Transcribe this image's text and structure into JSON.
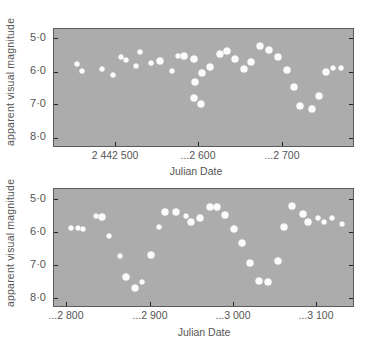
{
  "chart_data": [
    {
      "type": "scatter",
      "title": "",
      "xlabel": "Julian Date",
      "ylabel": "apparent visual magnitude",
      "xticks": [
        2442500,
        2442600,
        2442700
      ],
      "xtick_labels": [
        "2 442 500",
        "...2 600",
        "...2 700"
      ],
      "yticks": [
        5.0,
        6.0,
        7.0,
        8.0
      ],
      "ytick_labels": [
        "5·0",
        "6·0",
        "7·0",
        "8·0"
      ],
      "xlim": [
        2442453,
        2442790
      ],
      "ylim": [
        8.2,
        4.7
      ],
      "y_inverted": true,
      "grid": false,
      "points": [
        {
          "x": 2442454,
          "y": 5.78,
          "s": "m"
        },
        {
          "x": 2442460,
          "y": 5.99,
          "s": "m"
        },
        {
          "x": 2442484,
          "y": 5.93,
          "s": "m"
        },
        {
          "x": 2442498,
          "y": 6.11,
          "s": "m"
        },
        {
          "x": 2442507,
          "y": 5.57,
          "s": "m"
        },
        {
          "x": 2442513,
          "y": 5.66,
          "s": "m"
        },
        {
          "x": 2442525,
          "y": 5.84,
          "s": "m"
        },
        {
          "x": 2442530,
          "y": 5.42,
          "s": "m"
        },
        {
          "x": 2442543,
          "y": 5.75,
          "s": "m"
        },
        {
          "x": 2442554,
          "y": 5.69,
          "s": "l"
        },
        {
          "x": 2442569,
          "y": 5.99,
          "s": "m"
        },
        {
          "x": 2442576,
          "y": 5.54,
          "s": "m"
        },
        {
          "x": 2442583,
          "y": 5.54,
          "s": "l"
        },
        {
          "x": 2442595,
          "y": 5.63,
          "s": "l"
        },
        {
          "x": 2442605,
          "y": 6.05,
          "s": "l"
        },
        {
          "x": 2442596,
          "y": 6.32,
          "s": "l"
        },
        {
          "x": 2442595,
          "y": 6.8,
          "s": "l"
        },
        {
          "x": 2442604,
          "y": 6.98,
          "s": "l"
        },
        {
          "x": 2442614,
          "y": 5.87,
          "s": "l"
        },
        {
          "x": 2442626,
          "y": 5.48,
          "s": "l"
        },
        {
          "x": 2442635,
          "y": 5.39,
          "s": "l"
        },
        {
          "x": 2442645,
          "y": 5.63,
          "s": "l"
        },
        {
          "x": 2442656,
          "y": 5.93,
          "s": "l"
        },
        {
          "x": 2442664,
          "y": 5.72,
          "s": "l"
        },
        {
          "x": 2442675,
          "y": 5.24,
          "s": "l"
        },
        {
          "x": 2442686,
          "y": 5.36,
          "s": "l"
        },
        {
          "x": 2442696,
          "y": 5.57,
          "s": "l"
        },
        {
          "x": 2442707,
          "y": 5.96,
          "s": "l"
        },
        {
          "x": 2442716,
          "y": 6.47,
          "s": "l"
        },
        {
          "x": 2442723,
          "y": 7.04,
          "s": "l"
        },
        {
          "x": 2442737,
          "y": 7.13,
          "s": "l"
        },
        {
          "x": 2442746,
          "y": 6.74,
          "s": "l"
        },
        {
          "x": 2442754,
          "y": 6.02,
          "s": "l"
        },
        {
          "x": 2442763,
          "y": 5.9,
          "s": "m"
        },
        {
          "x": 2442772,
          "y": 5.9,
          "s": "m"
        }
      ]
    },
    {
      "type": "scatter",
      "title": "",
      "xlabel": "Julian Date",
      "ylabel": "apparent visual magnitude",
      "xticks": [
        2442800,
        2442900,
        2443000,
        2443100
      ],
      "xtick_labels": [
        "...2 800",
        "...2 900",
        "...3 000",
        "...3 100"
      ],
      "yticks": [
        5.0,
        6.0,
        7.0,
        8.0
      ],
      "ytick_labels": [
        "5·0",
        "6·0",
        "7·0",
        "8·0"
      ],
      "xlim": [
        2442785,
        2443138
      ],
      "ylim": [
        8.2,
        4.7
      ],
      "y_inverted": true,
      "grid": false,
      "points": [
        {
          "x": 2442806,
          "y": 5.88,
          "s": "m"
        },
        {
          "x": 2442814,
          "y": 5.88,
          "s": "m"
        },
        {
          "x": 2442820,
          "y": 5.91,
          "s": "m"
        },
        {
          "x": 2442836,
          "y": 5.51,
          "s": "m"
        },
        {
          "x": 2442843,
          "y": 5.55,
          "s": "l"
        },
        {
          "x": 2442852,
          "y": 6.12,
          "s": "m"
        },
        {
          "x": 2442865,
          "y": 6.73,
          "s": "m"
        },
        {
          "x": 2442872,
          "y": 7.35,
          "s": "l"
        },
        {
          "x": 2442883,
          "y": 7.7,
          "s": "l"
        },
        {
          "x": 2442892,
          "y": 7.51,
          "s": "m"
        },
        {
          "x": 2442902,
          "y": 6.7,
          "s": "l"
        },
        {
          "x": 2442912,
          "y": 5.85,
          "s": "m"
        },
        {
          "x": 2442919,
          "y": 5.4,
          "s": "l"
        },
        {
          "x": 2442932,
          "y": 5.38,
          "s": "l"
        },
        {
          "x": 2442945,
          "y": 5.52,
          "s": "m"
        },
        {
          "x": 2442951,
          "y": 5.69,
          "s": "l"
        },
        {
          "x": 2442961,
          "y": 5.57,
          "s": "l"
        },
        {
          "x": 2442973,
          "y": 5.25,
          "s": "l"
        },
        {
          "x": 2442982,
          "y": 5.25,
          "s": "l"
        },
        {
          "x": 2442992,
          "y": 5.48,
          "s": "l"
        },
        {
          "x": 2443002,
          "y": 5.9,
          "s": "l"
        },
        {
          "x": 2443012,
          "y": 6.34,
          "s": "l"
        },
        {
          "x": 2443022,
          "y": 6.95,
          "s": "l"
        },
        {
          "x": 2443033,
          "y": 7.47,
          "s": "l"
        },
        {
          "x": 2443043,
          "y": 7.53,
          "s": "l"
        },
        {
          "x": 2443055,
          "y": 6.88,
          "s": "l"
        },
        {
          "x": 2443063,
          "y": 5.84,
          "s": "l"
        },
        {
          "x": 2443072,
          "y": 5.21,
          "s": "l"
        },
        {
          "x": 2443086,
          "y": 5.45,
          "s": "l"
        },
        {
          "x": 2443092,
          "y": 5.69,
          "s": "l"
        },
        {
          "x": 2443104,
          "y": 5.57,
          "s": "m"
        },
        {
          "x": 2443111,
          "y": 5.69,
          "s": "m"
        },
        {
          "x": 2443120,
          "y": 5.57,
          "s": "m"
        },
        {
          "x": 2443132,
          "y": 5.75,
          "s": "m"
        }
      ]
    }
  ],
  "panels": [
    {
      "ylabel": "apparent visual magnitude",
      "xlabel": "Julian Date",
      "ytick_labels": [
        "5·0",
        "6·0",
        "7·0",
        "8·0"
      ],
      "xtick_labels": [
        "2 442 500",
        "...2 600",
        "...2 700"
      ]
    },
    {
      "ylabel": "apparent visual magnitude",
      "xlabel": "Julian Date",
      "ytick_labels": [
        "5·0",
        "6·0",
        "7·0",
        "8·0"
      ],
      "xtick_labels": [
        "...2 800",
        "...2 900",
        "...3 000",
        "...3 100"
      ]
    }
  ],
  "colors": {
    "plot_background": "#acacac",
    "points": "#fbfbfb",
    "frame": "#5a5a5a",
    "text": "#555555"
  }
}
